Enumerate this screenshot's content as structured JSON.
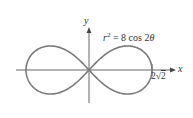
{
  "figure": {
    "equation": {
      "lhs_var": "r",
      "exponent": "2",
      "rhs": " = 8 cos 2",
      "theta": "θ"
    },
    "axes": {
      "x_label": "x",
      "y_label": "y"
    },
    "tick_label": {
      "coef": "2",
      "radical": "√",
      "radicand": "2"
    },
    "curve": {
      "name": "lemniscate",
      "a": 2.828,
      "color": "#7a7a7a"
    },
    "axis_color": "#555555"
  }
}
